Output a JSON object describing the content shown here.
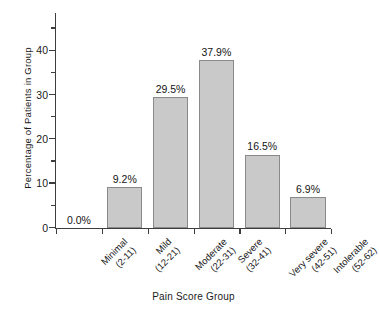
{
  "chart_data": {
    "type": "bar",
    "title": "",
    "xlabel": "Pain Score Group",
    "ylabel": "Percentage of Patients in Group",
    "categories": [
      "Minimal (2-11)",
      "Mild (12-21)",
      "Moderate (22-31)",
      "Severe (32-41)",
      "Very severe (42-51)",
      "Intolerable (52-62)"
    ],
    "category_lines": [
      {
        "line1": "Minimal",
        "line2": "(2-11)"
      },
      {
        "line1": "Mild",
        "line2": "(12-21)"
      },
      {
        "line1": "Moderate",
        "line2": "(22-31)"
      },
      {
        "line1": "Severe",
        "line2": "(32-41)"
      },
      {
        "line1": "Very severe",
        "line2": "(42-51)"
      },
      {
        "line1": "Intolerable",
        "line2": "(52-62)"
      }
    ],
    "values": [
      0.0,
      9.2,
      29.5,
      37.9,
      16.5,
      6.9
    ],
    "value_labels": [
      "0.0%",
      "9.2%",
      "29.5%",
      "37.9%",
      "16.5%",
      "6.9%"
    ],
    "ylim": [
      0,
      48.5
    ],
    "yticks_major": [
      0,
      10,
      20,
      30,
      40
    ],
    "ytick_labels": [
      "0",
      "10",
      "20",
      "30",
      "40"
    ],
    "yticks_minor": [
      5,
      15,
      25,
      35,
      45
    ],
    "grid": false,
    "legend": false,
    "bar_color": "#c9c9c9",
    "bar_edge_color": "#8a8a8a",
    "axis_color": "#3d3d3d",
    "background_color": "#ffffff"
  }
}
